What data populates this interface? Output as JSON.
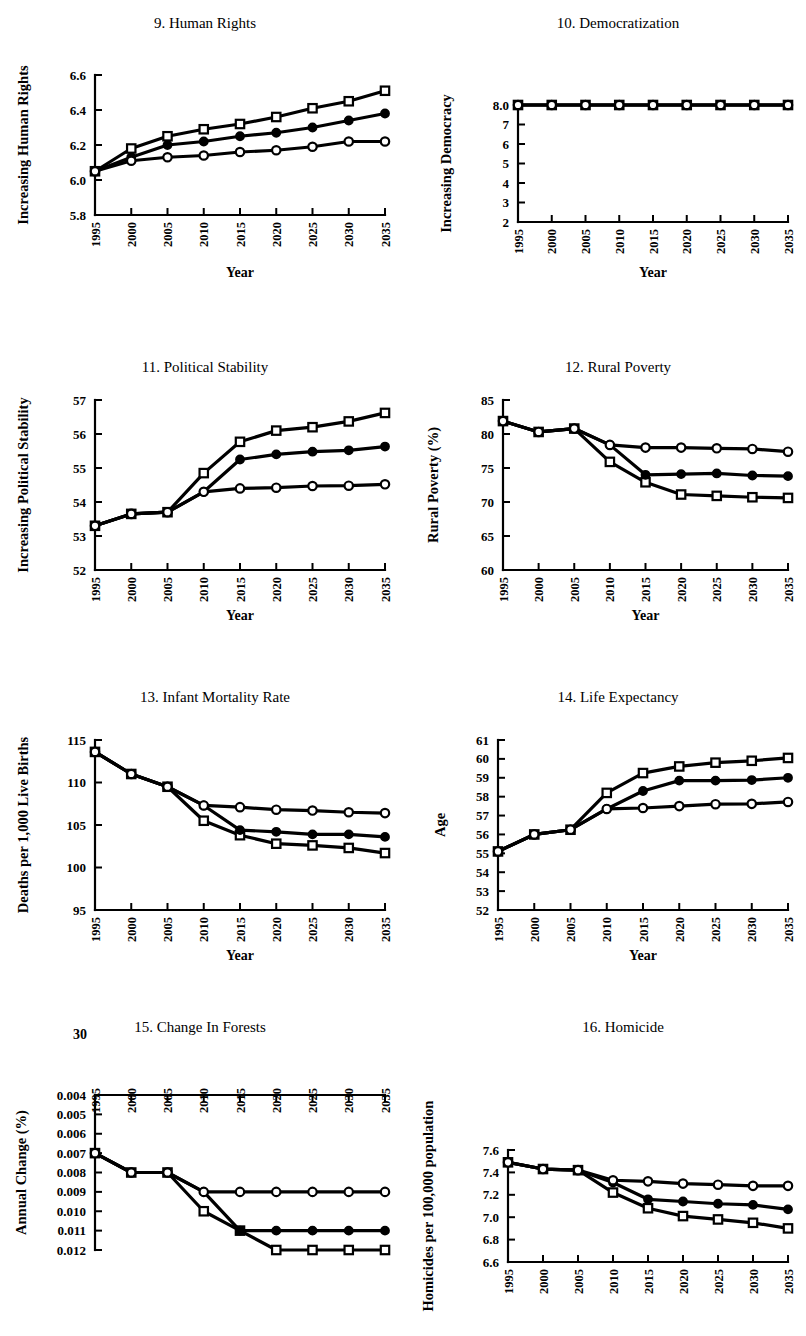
{
  "figure": {
    "panel_count": 8,
    "x_values": [
      1995,
      2000,
      2005,
      2010,
      2015,
      2020,
      2025,
      2030,
      2035
    ],
    "series_markers": [
      "open-square",
      "filled-circle",
      "open-circle"
    ],
    "xlabel_default": "Year"
  },
  "chart_data": [
    {
      "id": "panel-9",
      "type": "line",
      "title": "9. Human Rights",
      "xlabel": "Year",
      "ylabel": "Increasing Human Rights",
      "x": [
        1995,
        2000,
        2005,
        2010,
        2015,
        2020,
        2025,
        2030,
        2035
      ],
      "xticklabels": [
        "1995",
        "2000",
        "2005",
        "2010",
        "2015",
        "2020",
        "2025",
        "2030",
        "2035"
      ],
      "yticks": [
        5.8,
        6.0,
        6.2,
        6.4,
        6.6
      ],
      "yticklabels": [
        "5.8",
        "6.0",
        "6.2",
        "6.4",
        "6.6"
      ],
      "ylim": [
        5.8,
        6.6
      ],
      "grid": false,
      "legend": "none",
      "series": [
        {
          "name": "scenario-high",
          "marker": "open-square",
          "values": [
            6.05,
            6.18,
            6.25,
            6.29,
            6.32,
            6.36,
            6.41,
            6.45,
            6.51
          ]
        },
        {
          "name": "scenario-mid",
          "marker": "filled-circle",
          "values": [
            6.05,
            6.13,
            6.2,
            6.22,
            6.25,
            6.27,
            6.3,
            6.34,
            6.38
          ]
        },
        {
          "name": "scenario-low",
          "marker": "open-circle",
          "values": [
            6.05,
            6.11,
            6.13,
            6.14,
            6.16,
            6.17,
            6.19,
            6.22,
            6.22
          ]
        }
      ]
    },
    {
      "id": "panel-10",
      "type": "line",
      "title": "10. Democratization",
      "xlabel": "Year",
      "ylabel": "Increasing Democracy",
      "x": [
        1995,
        2000,
        2005,
        2010,
        2015,
        2020,
        2025,
        2030,
        2035
      ],
      "xticklabels": [
        "1995",
        "2000",
        "2005",
        "2010",
        "2015",
        "2020",
        "2025",
        "2030",
        "2035"
      ],
      "yticks": [
        2,
        3,
        4,
        5,
        6,
        7,
        8
      ],
      "yticklabels": [
        "2",
        "3",
        "4",
        "5",
        "6",
        "7",
        "8.0"
      ],
      "ylim": [
        2,
        8
      ],
      "grid": false,
      "legend": "none",
      "series": [
        {
          "name": "scenario-high",
          "marker": "open-square",
          "values": [
            8.0,
            8.0,
            8.0,
            8.0,
            8.0,
            8.0,
            8.0,
            8.0,
            8.0
          ]
        },
        {
          "name": "scenario-mid",
          "marker": "filled-circle",
          "values": [
            8.0,
            8.0,
            8.0,
            8.0,
            8.0,
            8.0,
            8.0,
            8.0,
            8.0
          ]
        },
        {
          "name": "scenario-low",
          "marker": "open-circle",
          "values": [
            8.0,
            8.0,
            8.0,
            8.0,
            8.0,
            8.0,
            8.0,
            8.0,
            8.0
          ]
        }
      ]
    },
    {
      "id": "panel-11",
      "type": "line",
      "title": "11. Political Stability",
      "xlabel": "Year",
      "ylabel": "Increasing Political Stability",
      "x": [
        1995,
        2000,
        2005,
        2010,
        2015,
        2020,
        2025,
        2030,
        2035
      ],
      "xticklabels": [
        "1995",
        "2000",
        "2005",
        "2010",
        "2015",
        "2020",
        "2025",
        "2030",
        "2035"
      ],
      "yticks": [
        52,
        53,
        54,
        55,
        56,
        57
      ],
      "yticklabels": [
        "52",
        "53",
        "54",
        "55",
        "56",
        "57"
      ],
      "ylim": [
        52,
        57
      ],
      "grid": false,
      "legend": "none",
      "series": [
        {
          "name": "scenario-high",
          "marker": "open-square",
          "values": [
            53.3,
            53.65,
            53.7,
            54.85,
            55.77,
            56.1,
            56.2,
            56.37,
            56.62
          ]
        },
        {
          "name": "scenario-mid",
          "marker": "filled-circle",
          "values": [
            53.3,
            53.65,
            53.7,
            54.3,
            55.25,
            55.4,
            55.48,
            55.52,
            55.63
          ]
        },
        {
          "name": "scenario-low",
          "marker": "open-circle",
          "values": [
            53.3,
            53.65,
            53.7,
            54.3,
            54.4,
            54.42,
            54.47,
            54.48,
            54.52
          ]
        }
      ]
    },
    {
      "id": "panel-12",
      "type": "line",
      "title": "12. Rural Poverty",
      "xlabel": "Year",
      "ylabel": "Rural Poverty (%)",
      "x": [
        1995,
        2000,
        2005,
        2010,
        2015,
        2020,
        2025,
        2030,
        2035
      ],
      "xticklabels": [
        "1995",
        "2000",
        "2005",
        "2010",
        "2015",
        "2020",
        "2025",
        "2030",
        "2035"
      ],
      "yticks": [
        60,
        65,
        70,
        75,
        80,
        85
      ],
      "yticklabels": [
        "60",
        "65",
        "70",
        "75",
        "80",
        "85"
      ],
      "ylim": [
        60,
        85
      ],
      "grid": false,
      "legend": "none",
      "series": [
        {
          "name": "scenario-high",
          "marker": "open-square",
          "values": [
            81.9,
            80.3,
            80.8,
            75.9,
            72.9,
            71.1,
            70.9,
            70.7,
            70.6
          ]
        },
        {
          "name": "scenario-mid",
          "marker": "filled-circle",
          "values": [
            81.9,
            80.3,
            80.8,
            78.4,
            74.0,
            74.1,
            74.2,
            73.9,
            73.8
          ]
        },
        {
          "name": "scenario-low",
          "marker": "open-circle",
          "values": [
            81.9,
            80.3,
            80.8,
            78.4,
            78.0,
            78.0,
            77.9,
            77.8,
            77.4
          ]
        }
      ]
    },
    {
      "id": "panel-13",
      "type": "line",
      "title": "13. Infant Mortality Rate",
      "xlabel": "Year",
      "ylabel": "Deaths per 1,000 Live Births",
      "x": [
        1995,
        2000,
        2005,
        2010,
        2015,
        2020,
        2025,
        2030,
        2035
      ],
      "xticklabels": [
        "1995",
        "2000",
        "2005",
        "2010",
        "2015",
        "2020",
        "2025",
        "2030",
        "2035"
      ],
      "yticks": [
        95,
        100,
        105,
        110,
        115
      ],
      "yticklabels": [
        "95",
        "100",
        "105",
        "110",
        "115"
      ],
      "ylim": [
        95,
        115
      ],
      "grid": false,
      "legend": "none",
      "series": [
        {
          "name": "scenario-high",
          "marker": "open-square",
          "values": [
            113.6,
            111.0,
            109.5,
            105.5,
            103.8,
            102.8,
            102.6,
            102.3,
            101.7
          ]
        },
        {
          "name": "scenario-mid",
          "marker": "filled-circle",
          "values": [
            113.6,
            111.0,
            109.5,
            107.3,
            104.4,
            104.2,
            103.9,
            103.9,
            103.6
          ]
        },
        {
          "name": "scenario-low",
          "marker": "open-circle",
          "values": [
            113.6,
            111.0,
            109.5,
            107.3,
            107.1,
            106.8,
            106.7,
            106.5,
            106.4
          ]
        }
      ]
    },
    {
      "id": "panel-14",
      "type": "line",
      "title": "14. Life Expectancy",
      "xlabel": "Year",
      "ylabel": "Age",
      "x": [
        1995,
        2000,
        2005,
        2010,
        2015,
        2020,
        2025,
        2030,
        2035
      ],
      "xticklabels": [
        "1995",
        "2000",
        "2005",
        "2010",
        "2015",
        "2020",
        "2025",
        "2030",
        "2035"
      ],
      "yticks": [
        52,
        53,
        54,
        55,
        56,
        57,
        58,
        59,
        60,
        61
      ],
      "yticklabels": [
        "52",
        "53",
        "54",
        "55",
        "56",
        "57",
        "58",
        "59",
        "60",
        "61"
      ],
      "ylim": [
        52,
        61
      ],
      "grid": false,
      "legend": "none",
      "series": [
        {
          "name": "scenario-high",
          "marker": "open-square",
          "values": [
            55.1,
            56.0,
            56.25,
            58.2,
            59.25,
            59.6,
            59.8,
            59.9,
            60.05
          ]
        },
        {
          "name": "scenario-mid",
          "marker": "filled-circle",
          "values": [
            55.1,
            56.0,
            56.25,
            57.35,
            58.3,
            58.85,
            58.85,
            58.88,
            59.0
          ]
        },
        {
          "name": "scenario-low",
          "marker": "open-circle",
          "values": [
            55.1,
            56.0,
            56.25,
            57.35,
            57.4,
            57.5,
            57.6,
            57.62,
            57.72
          ]
        }
      ]
    },
    {
      "id": "panel-15",
      "type": "line",
      "title": "15. Change In Forests",
      "xlabel": "",
      "ylabel": "Annual Change (%)",
      "x_axis_position": "top",
      "y_axis_inverted": true,
      "stray_label": "30",
      "x": [
        1995,
        2000,
        2005,
        2010,
        2015,
        2020,
        2025,
        2030,
        2035
      ],
      "xticklabels": [
        "1995",
        "2000",
        "2005",
        "2010",
        "2015",
        "2020",
        "2025",
        "2030",
        "2035"
      ],
      "yticks": [
        0.004,
        0.005,
        0.006,
        0.007,
        0.008,
        0.009,
        0.01,
        0.011,
        0.012
      ],
      "yticklabels": [
        "0.004",
        "0.005",
        "0.006",
        "0.007",
        "0.008",
        "0.009",
        "0.010",
        "0.011",
        "0.012"
      ],
      "ylim": [
        0.004,
        0.012
      ],
      "grid": false,
      "legend": "none",
      "series": [
        {
          "name": "scenario-high",
          "marker": "open-square",
          "values": [
            0.007,
            0.008,
            0.008,
            0.01,
            0.011,
            0.012,
            0.012,
            0.012,
            0.012
          ]
        },
        {
          "name": "scenario-mid",
          "marker": "filled-circle",
          "values": [
            0.007,
            0.008,
            0.008,
            0.009,
            0.011,
            0.011,
            0.011,
            0.011,
            0.011
          ]
        },
        {
          "name": "scenario-low",
          "marker": "open-circle",
          "values": [
            0.007,
            0.008,
            0.008,
            0.009,
            0.009,
            0.009,
            0.009,
            0.009,
            0.009
          ]
        }
      ]
    },
    {
      "id": "panel-16",
      "type": "line",
      "title": "16. Homicide",
      "xlabel": "",
      "ylabel": "Homicides per 100,000 population",
      "x": [
        1995,
        2000,
        2005,
        2010,
        2015,
        2020,
        2025,
        2030,
        2035
      ],
      "xticklabels": [
        "1995",
        "2000",
        "2005",
        "2010",
        "2015",
        "2020",
        "2025",
        "2030",
        "2035"
      ],
      "yticks": [
        6.6,
        6.8,
        7.0,
        7.2,
        7.4,
        7.6
      ],
      "yticklabels": [
        "6.6",
        "6.8",
        "7.0",
        "7.2",
        "7.4",
        "7.6"
      ],
      "ylim": [
        6.6,
        7.6
      ],
      "grid": false,
      "legend": "none",
      "series": [
        {
          "name": "scenario-high",
          "marker": "open-square",
          "values": [
            7.49,
            7.43,
            7.42,
            7.22,
            7.08,
            7.01,
            6.98,
            6.95,
            6.9
          ]
        },
        {
          "name": "scenario-mid",
          "marker": "filled-circle",
          "values": [
            7.49,
            7.43,
            7.42,
            7.31,
            7.16,
            7.14,
            7.12,
            7.11,
            7.07
          ]
        },
        {
          "name": "scenario-low",
          "marker": "open-circle",
          "values": [
            7.49,
            7.43,
            7.42,
            7.33,
            7.32,
            7.3,
            7.29,
            7.28,
            7.28
          ]
        }
      ]
    }
  ]
}
